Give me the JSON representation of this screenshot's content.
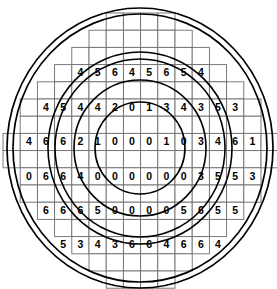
{
  "figure": {
    "type": "annotated-grid-diagram",
    "background_color": "#ffffff",
    "grid_line_color": "#6e6e6e",
    "ring_color": "#000000",
    "digit_color": "#000000"
  },
  "grid": {
    "cell_width": 17.2,
    "cell_height": 17.2,
    "origin_x": 3,
    "origin_y": 13,
    "columns": 16,
    "rows": 16,
    "note": "Stepped circular boundary; each row spans a contiguous range of columns",
    "row_spans": [
      {
        "row": 0,
        "start": 6,
        "end": 10
      },
      {
        "row": 1,
        "start": 5,
        "end": 11
      },
      {
        "row": 2,
        "start": 4,
        "end": 12
      },
      {
        "row": 3,
        "start": 3,
        "end": 13
      },
      {
        "row": 4,
        "start": 2,
        "end": 14
      },
      {
        "row": 5,
        "start": 1,
        "end": 15
      },
      {
        "row": 6,
        "start": 1,
        "end": 15
      },
      {
        "row": 7,
        "start": 0,
        "end": 16
      },
      {
        "row": 8,
        "start": 0,
        "end": 16
      },
      {
        "row": 9,
        "start": 1,
        "end": 15
      },
      {
        "row": 10,
        "start": 1,
        "end": 15
      },
      {
        "row": 11,
        "start": 2,
        "end": 14
      },
      {
        "row": 12,
        "start": 3,
        "end": 13
      },
      {
        "row": 13,
        "start": 4,
        "end": 12
      },
      {
        "row": 14,
        "start": 5,
        "end": 11
      },
      {
        "row": 15,
        "start": 6,
        "end": 10
      }
    ]
  },
  "values": {
    "rows": [
      {
        "row": 3,
        "start_col": 4,
        "digits": [
          "4",
          "5",
          "6",
          "4",
          "5",
          "6",
          "5",
          "4"
        ]
      },
      {
        "row": 5,
        "start_col": 2,
        "digits": [
          "4",
          "5",
          "4",
          "4",
          "2",
          "0",
          "1",
          "3",
          "4",
          "3",
          "5",
          "3"
        ]
      },
      {
        "row": 7,
        "start_col": 1,
        "digits": [
          "4",
          "6",
          "6",
          "2",
          "1",
          "0",
          "0",
          "0",
          "1",
          "0",
          "3",
          "4",
          "6",
          "1"
        ]
      },
      {
        "row": 9,
        "start_col": 1,
        "digits": [
          "0",
          "6",
          "6",
          "4",
          "0",
          "0",
          "0",
          "0",
          "0",
          "0",
          "3",
          "5",
          "5",
          "3"
        ]
      },
      {
        "row": 11,
        "start_col": 2,
        "digits": [
          "6",
          "6",
          "6",
          "5",
          "0",
          "0",
          "0",
          "0",
          "5",
          "6",
          "5",
          "5"
        ]
      },
      {
        "row": 13,
        "start_col": 3,
        "digits": [
          "5",
          "3",
          "4",
          "3",
          "6",
          "6",
          "4",
          "6",
          "6",
          "4"
        ]
      }
    ]
  },
  "rings": {
    "center_x": 140,
    "center_y": 148,
    "items": [
      {
        "name": "ring-1-outermost-a",
        "rx": 133,
        "ry": 140
      },
      {
        "name": "ring-1-outermost-b",
        "rx": 127,
        "ry": 134
      },
      {
        "name": "ring-2-a",
        "rx": 92,
        "ry": 96
      },
      {
        "name": "ring-2-b",
        "rx": 85,
        "ry": 89
      },
      {
        "name": "ring-3-a",
        "rx": 66,
        "ry": 68
      },
      {
        "name": "ring-4-innermost",
        "rx": 45,
        "ry": 46
      }
    ]
  }
}
